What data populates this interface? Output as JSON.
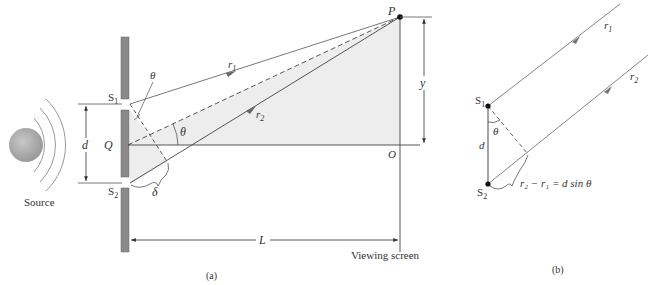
{
  "figure": {
    "panel_a": {
      "caption": "(a)",
      "source_label": "Source",
      "slit1_label": "S",
      "slit1_sub": "1",
      "slit2_label": "S",
      "slit2_sub": "2",
      "separation_label": "d",
      "midpoint_label": "Q",
      "angle_label": "θ",
      "angle_label_top": "θ",
      "path_diff_label": "δ",
      "ray1_label": "r",
      "ray1_sub": "1",
      "ray2_label": "r",
      "ray2_sub": "2",
      "point_label": "P",
      "origin_label": "O",
      "height_label": "y",
      "distance_label": "L",
      "screen_label": "Viewing screen"
    },
    "panel_b": {
      "caption": "(b)",
      "slit1_label": "S",
      "slit1_sub": "1",
      "slit2_label": "S",
      "slit2_sub": "2",
      "separation_label": "d",
      "angle_label": "θ",
      "ray1_label": "r",
      "ray1_sub": "1",
      "ray2_label": "r",
      "ray2_sub": "2",
      "equation": "r₂ − r₁ = d sin θ"
    },
    "colors": {
      "barrier": "#8a8a8a",
      "shade": "#ededed",
      "line": "#555555",
      "source": "#a8a8a8"
    }
  }
}
